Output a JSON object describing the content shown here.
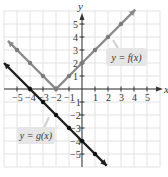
{
  "chart_data": {
    "type": "line",
    "title": "",
    "xlabel": "x",
    "ylabel": "y",
    "xlim": [
      -6,
      6
    ],
    "ylim": [
      -6,
      6
    ],
    "grid": true,
    "x_ticks": [
      -5,
      -4,
      -3,
      -2,
      -1,
      1,
      2,
      3,
      4,
      5
    ],
    "y_ticks": [
      -5,
      -4,
      -3,
      -2,
      -1,
      1,
      2,
      3,
      4,
      5
    ],
    "series": [
      {
        "name": "y = f(x)",
        "label": "y = f(x)",
        "color": "#888888",
        "x": [
          -5.7,
          -5,
          -4,
          -3,
          -2,
          -1,
          0,
          1,
          2,
          3,
          4.1
        ],
        "y": [
          3.7,
          3,
          2,
          1,
          0,
          1,
          2,
          3,
          4,
          5,
          6.1
        ],
        "points": [
          [
            -5,
            3
          ],
          [
            -4,
            2
          ],
          [
            -3,
            1
          ],
          [
            -2,
            0
          ],
          [
            -1,
            1
          ],
          [
            0,
            2
          ],
          [
            1,
            3
          ],
          [
            2,
            4
          ],
          [
            3,
            5
          ]
        ]
      },
      {
        "name": "y = g(x)",
        "label": "y = g(x)",
        "color": "#222222",
        "x": [
          -6,
          -4,
          -3,
          -2,
          -1,
          0,
          1,
          1.9
        ],
        "y": [
          2,
          0,
          -1,
          -2,
          -3,
          -4,
          -5,
          -5.9
        ],
        "points": [
          [
            -4,
            0
          ],
          [
            -3,
            -1
          ],
          [
            -2,
            -2
          ],
          [
            -1,
            -3
          ],
          [
            0,
            -4
          ],
          [
            1,
            -5
          ]
        ]
      }
    ]
  },
  "labels": {
    "x_axis": "x",
    "y_axis": "y",
    "f_label": "y = f(x)",
    "g_label": "y = g(x)",
    "x_ticks": [
      "−5",
      "−4",
      "−3",
      "−2",
      "−1",
      "1",
      "2",
      "3",
      "4",
      "5"
    ],
    "y_ticks": [
      "5",
      "4",
      "3",
      "2",
      "1",
      "−1",
      "−2",
      "−3",
      "−4",
      "−5"
    ]
  },
  "colors": {
    "grid": "#e2e2e2",
    "axis": "#333333",
    "f_line": "#8a8a8a",
    "f_dot": "#7a7a7a",
    "g_line": "#1e1e1e",
    "g_dot": "#111111",
    "label_bg": "#e6e6e6"
  }
}
